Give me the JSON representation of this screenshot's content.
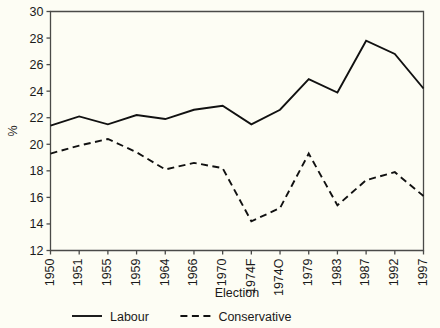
{
  "chart_data": {
    "type": "line",
    "title": "",
    "xlabel": "Election",
    "ylabel": "%",
    "ylim": [
      12,
      30
    ],
    "ytick_values": [
      12,
      14,
      16,
      18,
      20,
      22,
      24,
      26,
      28,
      30
    ],
    "ytick_labels": [
      "12",
      "14",
      "16",
      "18",
      "20",
      "22",
      "24",
      "26",
      "28",
      "30"
    ],
    "categories": [
      "1950",
      "1951",
      "1955",
      "1959",
      "1964",
      "1966",
      "1970",
      "1974F",
      "1974O",
      "1979",
      "1983",
      "1987",
      "1992",
      "1997"
    ],
    "grid": false,
    "legend_position": "bottom",
    "series": [
      {
        "name": "Labour",
        "style": "solid",
        "color": "#111111",
        "values": [
          21.4,
          22.1,
          21.5,
          22.2,
          21.9,
          22.6,
          22.9,
          21.5,
          22.6,
          24.9,
          23.9,
          27.8,
          26.8,
          24.2
        ]
      },
      {
        "name": "Conservative",
        "style": "dashed",
        "color": "#111111",
        "values": [
          19.3,
          19.9,
          20.4,
          19.4,
          18.1,
          18.6,
          18.2,
          14.2,
          15.2,
          19.3,
          15.4,
          17.3,
          17.9,
          16.1
        ]
      }
    ]
  },
  "legend": {
    "items": [
      {
        "label": "Labour",
        "style": "solid"
      },
      {
        "label": "Conservative",
        "style": "dashed"
      }
    ]
  }
}
